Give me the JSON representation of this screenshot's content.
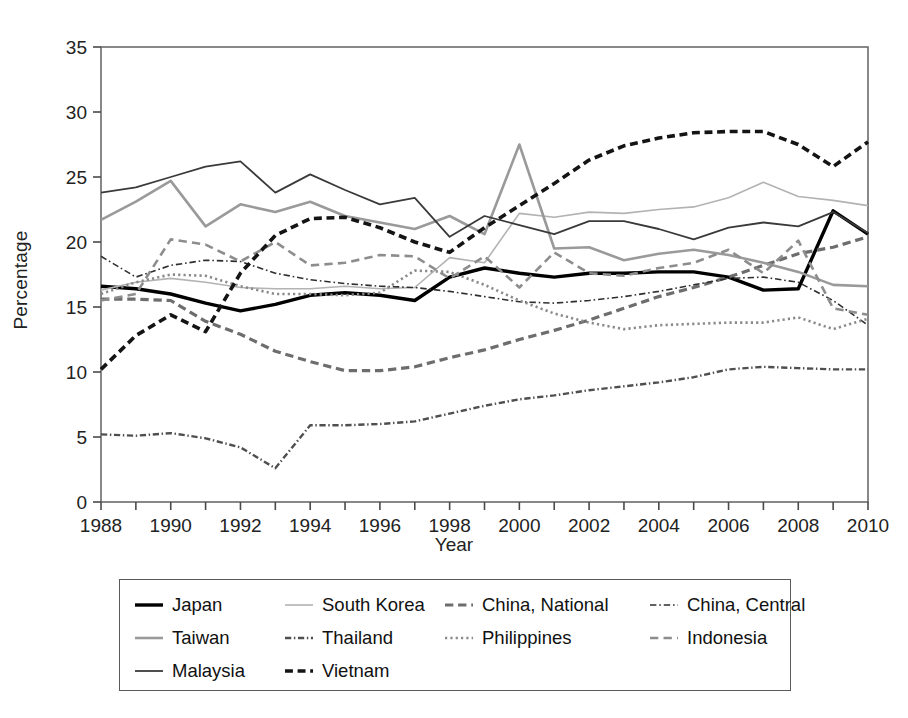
{
  "chart_data": {
    "type": "line",
    "title": "",
    "xlabel": "Year",
    "ylabel": "Percentage",
    "xlim": [
      1988,
      2010
    ],
    "ylim": [
      0,
      35
    ],
    "yticks": [
      0,
      5,
      10,
      15,
      20,
      25,
      30,
      35
    ],
    "xticks": [
      1988,
      1989,
      1990,
      1991,
      1992,
      1993,
      1994,
      1995,
      1996,
      1997,
      1998,
      1999,
      2000,
      2001,
      2002,
      2003,
      2004,
      2005,
      2006,
      2007,
      2008,
      2009,
      2010
    ],
    "xtick_labels": [
      "1988",
      "",
      "1990",
      "",
      "1992",
      "",
      "1994",
      "",
      "1996",
      "",
      "1998",
      "",
      "2000",
      "",
      "2002",
      "",
      "2004",
      "",
      "2006",
      "",
      "2008",
      "",
      "2010"
    ],
    "grid": false,
    "legend_position": "below-plot",
    "x": [
      1988,
      1989,
      1990,
      1991,
      1992,
      1993,
      1994,
      1995,
      1996,
      1997,
      1998,
      1999,
      2000,
      2001,
      2002,
      2003,
      2004,
      2005,
      2006,
      2007,
      2008,
      2009,
      2010
    ],
    "series": [
      {
        "name": "Japan",
        "style": "solid",
        "color": "#000000",
        "width": 3.4,
        "values": [
          16.6,
          16.4,
          16.0,
          15.3,
          14.7,
          15.2,
          15.9,
          16.1,
          15.9,
          15.5,
          17.3,
          18.0,
          17.6,
          17.3,
          17.6,
          17.6,
          17.7,
          17.7,
          17.3,
          16.3,
          16.4,
          22.4,
          20.6
        ]
      },
      {
        "name": "South Korea",
        "style": "solid",
        "color": "#b3b3b3",
        "width": 1.6,
        "values": [
          16.3,
          16.9,
          17.2,
          16.9,
          16.5,
          16.4,
          16.4,
          16.6,
          16.4,
          16.5,
          18.8,
          18.4,
          22.2,
          21.9,
          22.3,
          22.2,
          22.5,
          22.7,
          23.4,
          24.6,
          23.5,
          23.2,
          22.8
        ]
      },
      {
        "name": "China, National",
        "style": "dashed",
        "color": "#6d6d6d",
        "width": 3.2,
        "values": [
          15.6,
          15.6,
          15.5,
          13.9,
          12.9,
          11.6,
          10.8,
          10.1,
          10.1,
          10.4,
          11.1,
          11.7,
          12.5,
          13.2,
          14.0,
          14.9,
          15.8,
          16.5,
          17.3,
          18.2,
          19.1,
          19.6,
          20.4
        ]
      },
      {
        "name": "China, Central",
        "style": "dashdot-thin",
        "color": "#2f2f2f",
        "width": 1.6,
        "values": [
          18.9,
          17.3,
          18.2,
          18.6,
          18.5,
          17.6,
          17.1,
          16.8,
          16.6,
          16.5,
          16.2,
          15.8,
          15.4,
          15.3,
          15.5,
          15.8,
          16.2,
          16.7,
          17.2,
          17.3,
          16.9,
          15.5,
          13.6
        ]
      },
      {
        "name": "Taiwan",
        "style": "solid",
        "color": "#9a9a9a",
        "width": 2.6,
        "values": [
          21.7,
          23.1,
          24.7,
          21.2,
          22.9,
          22.3,
          23.1,
          22.0,
          21.5,
          21.0,
          22.0,
          20.6,
          27.5,
          19.5,
          19.6,
          18.6,
          19.1,
          19.4,
          19.0,
          18.4,
          17.7,
          16.7,
          16.6
        ]
      },
      {
        "name": "Thailand",
        "style": "dashdot",
        "color": "#4f4f4f",
        "width": 2.4,
        "values": [
          5.2,
          5.1,
          5.3,
          4.9,
          4.2,
          2.6,
          5.9,
          5.9,
          6.0,
          6.2,
          6.8,
          7.4,
          7.9,
          8.2,
          8.6,
          8.9,
          9.2,
          9.6,
          10.2,
          10.4,
          10.3,
          10.2,
          10.2
        ]
      },
      {
        "name": "Philippines",
        "style": "dotted",
        "color": "#8a8a8a",
        "width": 2.6,
        "values": [
          16.0,
          16.9,
          17.5,
          17.4,
          16.6,
          16.0,
          16.0,
          15.9,
          16.1,
          17.8,
          17.7,
          16.7,
          15.5,
          14.5,
          13.8,
          13.3,
          13.6,
          13.7,
          13.8,
          13.8,
          14.2,
          13.3,
          14.1
        ]
      },
      {
        "name": "Indonesia",
        "style": "dashed-med",
        "color": "#8d8d8d",
        "width": 2.6,
        "values": [
          15.5,
          16.0,
          20.2,
          19.8,
          18.5,
          20.0,
          18.2,
          18.4,
          19.0,
          18.9,
          17.2,
          18.9,
          16.5,
          19.2,
          17.6,
          17.4,
          18.0,
          18.4,
          19.4,
          17.6,
          20.1,
          14.9,
          14.4
        ]
      },
      {
        "name": "Malaysia",
        "style": "solid",
        "color": "#3a3a3a",
        "width": 1.8,
        "values": [
          23.8,
          24.2,
          25.0,
          25.8,
          26.2,
          23.8,
          25.2,
          24.0,
          22.9,
          23.4,
          20.4,
          22.0,
          21.3,
          20.6,
          21.6,
          21.6,
          21.0,
          20.2,
          21.1,
          21.5,
          21.2,
          22.3,
          20.7
        ]
      },
      {
        "name": "Vietnam",
        "style": "dashed-thick",
        "color": "#141414",
        "width": 3.6,
        "values": [
          10.2,
          12.8,
          14.4,
          13.1,
          17.6,
          20.5,
          21.8,
          21.9,
          21.1,
          20.0,
          19.2,
          21.1,
          22.8,
          24.5,
          26.3,
          27.4,
          28.0,
          28.4,
          28.5,
          28.5,
          27.5,
          25.8,
          27.7
        ]
      }
    ]
  },
  "legend": {
    "items": [
      {
        "label": "Japan"
      },
      {
        "label": "South Korea"
      },
      {
        "label": "China, National"
      },
      {
        "label": "China, Central"
      },
      {
        "label": "Taiwan"
      },
      {
        "label": "Thailand"
      },
      {
        "label": "Philippines"
      },
      {
        "label": "Indonesia"
      },
      {
        "label": "Malaysia"
      },
      {
        "label": "Vietnam"
      }
    ]
  },
  "axes": {
    "y_title": "Percentage",
    "x_title": "Year"
  }
}
